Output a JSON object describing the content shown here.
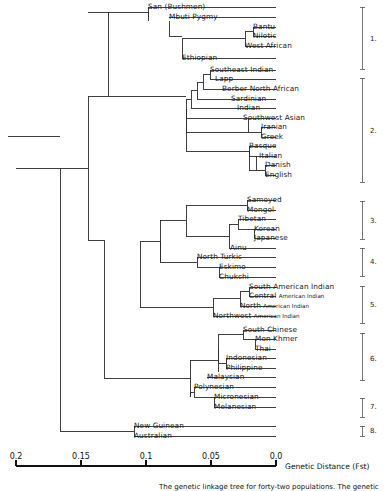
{
  "figure": {
    "axis": {
      "title": "Genetic Distance (Fst)",
      "ticks": [
        "0.2",
        "0.15",
        "0.1",
        "0.05",
        "0.0"
      ],
      "tick_values": [
        0.2,
        0.15,
        0.1,
        0.05,
        0.0
      ],
      "x_pixels": [
        16,
        81,
        146,
        211,
        276
      ],
      "line_y": 466,
      "label_y": 452
    },
    "caption": "The genetic linkage tree for forty-two populations.  The genetic",
    "groups": [
      {
        "num": "1.",
        "label_y": 39,
        "top": 7,
        "bottom": 69
      },
      {
        "num": "2.",
        "label_y": 131,
        "top": 78,
        "bottom": 182
      },
      {
        "num": "3.",
        "label_y": 221,
        "top": 201,
        "bottom": 239
      },
      {
        "num": "4.",
        "label_y": 262,
        "top": 248,
        "bottom": 276
      },
      {
        "num": "5.",
        "label_y": 305,
        "top": 286,
        "bottom": 323
      },
      {
        "num": "6.",
        "label_y": 359,
        "top": 333,
        "bottom": 380
      },
      {
        "num": "7.",
        "label_y": 407,
        "top": 398,
        "bottom": 417
      },
      {
        "num": "8.",
        "label_y": 431,
        "top": 426,
        "bottom": 436
      }
    ],
    "leaves": [
      {
        "name": "San (Bushmen)",
        "y": 7,
        "x": 148,
        "small": ""
      },
      {
        "name": "Mbuti Pygmy",
        "y": 17,
        "x": 169,
        "small": ""
      },
      {
        "name": "Bantu",
        "y": 27,
        "x": 253,
        "small": ""
      },
      {
        "name": "Nilotic",
        "y": 36,
        "x": 253,
        "small": ""
      },
      {
        "name": "West African",
        "y": 46,
        "x": 245,
        "small": ""
      },
      {
        "name": "Ethiopian",
        "y": 58,
        "x": 182,
        "small": ""
      },
      {
        "name": "Southeast Indian",
        "y": 70,
        "x": 210,
        "small": ""
      },
      {
        "name": "Lapp",
        "y": 79,
        "x": 215,
        "small": ""
      },
      {
        "name": "Berber North African",
        "y": 89,
        "x": 222,
        "small": ""
      },
      {
        "name": "Sardinian",
        "y": 99,
        "x": 231,
        "small": ""
      },
      {
        "name": "Indian",
        "y": 108,
        "x": 237,
        "small": ""
      },
      {
        "name": "Southwest Asian",
        "y": 118,
        "x": 243,
        "small": ""
      },
      {
        "name": "Iranian",
        "y": 127,
        "x": 261,
        "small": ""
      },
      {
        "name": "Greek",
        "y": 137,
        "x": 261,
        "small": ""
      },
      {
        "name": "Basque",
        "y": 146,
        "x": 249,
        "small": ""
      },
      {
        "name": "Italian",
        "y": 156,
        "x": 259,
        "small": ""
      },
      {
        "name": "Danish",
        "y": 165,
        "x": 265,
        "small": ""
      },
      {
        "name": "English",
        "y": 175,
        "x": 265,
        "small": ""
      },
      {
        "name": "Samoyed",
        "y": 200,
        "x": 247,
        "small": ""
      },
      {
        "name": "Mongol",
        "y": 210,
        "x": 247,
        "small": ""
      },
      {
        "name": "Tibetan",
        "y": 219,
        "x": 238,
        "small": ""
      },
      {
        "name": "Korean",
        "y": 229,
        "x": 254,
        "small": ""
      },
      {
        "name": "Japanese",
        "y": 238,
        "x": 254,
        "small": ""
      },
      {
        "name": "Ainu",
        "y": 248,
        "x": 230,
        "small": ""
      },
      {
        "name": "North Turkic",
        "y": 257,
        "x": 197,
        "small": ""
      },
      {
        "name": "Eskimo",
        "y": 267,
        "x": 219,
        "small": ""
      },
      {
        "name": "Chukchi",
        "y": 277,
        "x": 219,
        "small": ""
      },
      {
        "name": "South American Indian",
        "y": 287,
        "x": 249,
        "small": ""
      },
      {
        "name": "Central ",
        "y": 296,
        "x": 249,
        "small": "American Indian"
      },
      {
        "name": "North ",
        "y": 306,
        "x": 240,
        "small": "American Indian"
      },
      {
        "name": "Northwest ",
        "y": 316,
        "x": 213,
        "small": "American Indian"
      },
      {
        "name": "South Chinese",
        "y": 330,
        "x": 243,
        "small": ""
      },
      {
        "name": "Mon Khmer",
        "y": 339,
        "x": 255,
        "small": ""
      },
      {
        "name": "Thai",
        "y": 349,
        "x": 255,
        "small": ""
      },
      {
        "name": "Indonesian",
        "y": 358,
        "x": 226,
        "small": ""
      },
      {
        "name": "Philippine",
        "y": 368,
        "x": 226,
        "small": ""
      },
      {
        "name": "Malaysian",
        "y": 377,
        "x": 207,
        "small": ""
      },
      {
        "name": "Polynesian",
        "y": 387,
        "x": 194,
        "small": ""
      },
      {
        "name": "Micronesian",
        "y": 397,
        "x": 214,
        "small": ""
      },
      {
        "name": "Melanesian",
        "y": 407,
        "x": 214,
        "small": ""
      },
      {
        "name": "New Guinean",
        "y": 426,
        "x": 134,
        "small": ""
      },
      {
        "name": "Australian",
        "y": 436,
        "x": 134,
        "small": ""
      }
    ],
    "tree_paths": [
      "M276,7 H148 V16.5 M276,17 H169",
      "M276,27 H253 V36 M276,36 H253",
      "M253,31.5 H245 V46 M276,46 H245",
      "M245,38.5 H182 V58 M276,58 H182",
      "M169,21 V36 H182",
      "M148,12 V21",
      "M148,12 H108",
      "M276,70 H210 V79 M276,79 H215 M215,79 H210",
      "M210,74.5 H203 V89 M276,89 H222 M222,89 H203",
      "M203,82 H197 V99 M276,99 H231 M231,99 H197",
      "M197,90.5 H191 V108 M276,108 H237 M237,108 H191",
      "M191,99 H186 V118 M276,118 H243 M243,118 H186",
      "M276,127 H261 V137 M276,137 H261",
      "M261,132 H248 V118",
      "M186,108.5 V132 H248",
      "M276,146 H249 V156",
      "M276,156 H259 M259,156 H249",
      "M276,165 H265 V175 M276,175 H265",
      "M265,170 H256 V156",
      "M249,151 V170 H256",
      "M186,125 V151 H249",
      "M186,118 V125",
      "M186,96 H88",
      "M276,200 H247 V210 M276,210 H247",
      "M276,219 H238 V229 M276,229 H254 M254,229 H238",
      "M276,238 H254 V229",
      "M238,224 H229 V248 M276,248 H229",
      "M247,205 H186 V236 M229,236 H186",
      "M276,257 H197 V267",
      "M276,267 H219 M219,267 H197",
      "M276,277 H219 V267",
      "M197,262 H160 V220",
      "M186,220 H160",
      "M160,241 V262",
      "M276,287 H249 V296 M276,296 H249",
      "M249,291.5 H240 V306 M276,306 H240",
      "M240,298.5 H213 V316 M276,316 H213",
      "M213,307 H140",
      "M160,241 H140 V307",
      "M276,330 H243 V339",
      "M276,339 H255 M255,339 H243",
      "M276,349 H255 V339",
      "M243,334.5 H218 V363",
      "M276,358 H226 V368 M276,368 H226",
      "M226,363 H218",
      "M218,348.7 V372 M276,377 H207 M207,377 H218",
      "M218,360 H190",
      "M276,387 H194 V397",
      "M276,397 H214 M214,397 H194",
      "M276,407 H214 V397",
      "M194,392 H190 V397",
      "M190,360 V397",
      "M190,378 H104",
      "M276,426 H134 V436 M276,436 H134",
      "M134,431 H60",
      "M104,378 V240",
      "M88,96 V240",
      "M88,240 H104",
      "M88,168 H60",
      "M60,168 V431",
      "M60,168 H16",
      "M108,12 V96",
      "M108,12 H88",
      "M16,136 H60 M16,136 H8"
    ]
  }
}
